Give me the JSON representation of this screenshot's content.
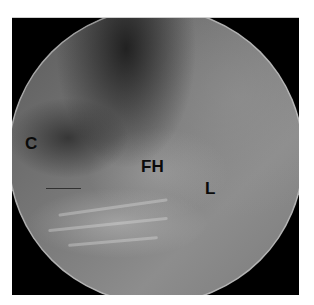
{
  "image": {
    "description": "Arthroscopic view with circular field of view on black background",
    "labels": {
      "c": "C",
      "fh": "FH",
      "l": "L"
    },
    "colors": {
      "background": "#000000",
      "tissue_mid": "#7a7a7a",
      "label_text": "#0a0a0a"
    }
  }
}
